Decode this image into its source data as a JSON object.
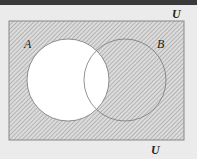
{
  "diagram": {
    "type": "venn",
    "shaded_region": "complement of A (A')",
    "universe_label_top": "U",
    "universe_label_bottom": "U",
    "set_a_label": "A",
    "set_b_label": "B"
  },
  "colors": {
    "background": "#ebebeb",
    "top_bar": "#3a3a3a",
    "hatch_line": "#9a9a9a",
    "hatch_bg": "#dcdcdc",
    "set_a_fill": "#ffffff",
    "outline": "#777777"
  }
}
